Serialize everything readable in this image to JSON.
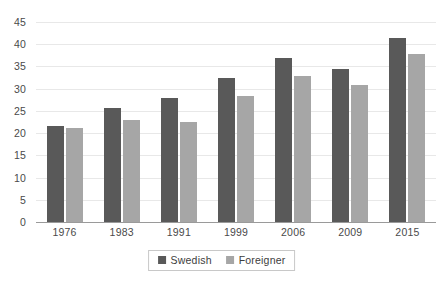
{
  "chart_data": {
    "type": "bar",
    "title": "",
    "subtitle": "",
    "xlabel": "",
    "ylabel": "",
    "categories": [
      "1976",
      "1983",
      "1991",
      "1999",
      "2006",
      "2009",
      "2015"
    ],
    "series": [
      {
        "name": "Swedish",
        "color": "#595959",
        "values": [
          21.6,
          25.7,
          27.9,
          32.4,
          37.0,
          34.5,
          41.4
        ]
      },
      {
        "name": "Foreigner",
        "color": "#a6a6a6",
        "values": [
          21.2,
          23.0,
          22.5,
          28.4,
          32.9,
          30.8,
          37.7
        ]
      }
    ],
    "ylim": [
      0,
      45
    ],
    "ytick_step": 5,
    "ytick_labels": [
      "0",
      "5",
      "10",
      "15",
      "20",
      "25",
      "30",
      "35",
      "40",
      "45"
    ],
    "grid": true,
    "grid_color": "#e8e8e8",
    "axis_color": "#9a9a9a",
    "legend_position": "bottom",
    "background": "#ffffff",
    "annotations": []
  }
}
